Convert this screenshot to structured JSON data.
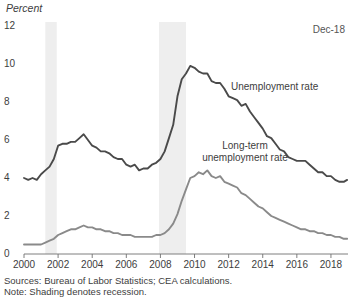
{
  "chart_data": {
    "type": "line",
    "title": "",
    "subtitle": "",
    "xlabel": "",
    "ylabel": "Percent",
    "ylim": [
      0,
      12
    ],
    "xlim": [
      2000.0,
      2019.0
    ],
    "yticks": [
      0,
      2,
      4,
      6,
      8,
      10,
      12
    ],
    "xticks": [
      2000,
      2002,
      2004,
      2006,
      2008,
      2010,
      2012,
      2014,
      2016,
      2018
    ],
    "grid": false,
    "legend_position": "inline-annotations",
    "annotations": [
      {
        "text": "Dec-18",
        "position": "top-right"
      },
      {
        "text": "Unemployment rate",
        "series": "Unemployment rate"
      },
      {
        "text": "Long-term unemployment rate",
        "series": "Long-term unemployment rate"
      }
    ],
    "shaded_regions": [
      {
        "label": "recession",
        "x0": 2001.25,
        "x1": 2001.92
      },
      {
        "label": "recession",
        "x0": 2007.92,
        "x1": 2009.5
      }
    ],
    "series": [
      {
        "name": "Unemployment rate",
        "color": "#4a4a4a",
        "x": [
          2000.0,
          2000.25,
          2000.5,
          2000.75,
          2001.0,
          2001.25,
          2001.5,
          2001.75,
          2002.0,
          2002.25,
          2002.5,
          2002.75,
          2003.0,
          2003.25,
          2003.5,
          2003.75,
          2004.0,
          2004.25,
          2004.5,
          2004.75,
          2005.0,
          2005.25,
          2005.5,
          2005.75,
          2006.0,
          2006.25,
          2006.5,
          2006.75,
          2007.0,
          2007.25,
          2007.5,
          2007.75,
          2008.0,
          2008.25,
          2008.5,
          2008.75,
          2009.0,
          2009.25,
          2009.5,
          2009.75,
          2010.0,
          2010.25,
          2010.5,
          2010.75,
          2011.0,
          2011.25,
          2011.5,
          2011.75,
          2012.0,
          2012.25,
          2012.5,
          2012.75,
          2013.0,
          2013.25,
          2013.5,
          2013.75,
          2014.0,
          2014.25,
          2014.5,
          2014.75,
          2015.0,
          2015.25,
          2015.5,
          2015.75,
          2016.0,
          2016.25,
          2016.5,
          2016.75,
          2017.0,
          2017.25,
          2017.5,
          2017.75,
          2018.0,
          2018.25,
          2018.5,
          2018.75,
          2018.95
        ],
        "values": [
          4.0,
          3.9,
          4.0,
          3.9,
          4.2,
          4.4,
          4.6,
          5.0,
          5.7,
          5.8,
          5.8,
          5.9,
          5.9,
          6.1,
          6.3,
          6.0,
          5.7,
          5.6,
          5.4,
          5.4,
          5.3,
          5.1,
          5.0,
          5.0,
          4.7,
          4.6,
          4.7,
          4.4,
          4.5,
          4.5,
          4.7,
          4.8,
          5.0,
          5.4,
          6.1,
          6.8,
          8.3,
          9.2,
          9.5,
          9.9,
          9.8,
          9.6,
          9.5,
          9.5,
          9.1,
          9.0,
          9.0,
          8.7,
          8.3,
          8.2,
          8.1,
          7.8,
          7.9,
          7.5,
          7.2,
          6.9,
          6.6,
          6.2,
          6.1,
          5.8,
          5.5,
          5.4,
          5.1,
          5.0,
          4.9,
          4.9,
          4.9,
          4.7,
          4.5,
          4.3,
          4.3,
          4.1,
          4.1,
          3.9,
          3.8,
          3.8,
          3.9
        ]
      },
      {
        "name": "Long-term unemployment rate",
        "color": "#8a8a8a",
        "x": [
          2000.0,
          2000.25,
          2000.5,
          2000.75,
          2001.0,
          2001.25,
          2001.5,
          2001.75,
          2002.0,
          2002.25,
          2002.5,
          2002.75,
          2003.0,
          2003.25,
          2003.5,
          2003.75,
          2004.0,
          2004.25,
          2004.5,
          2004.75,
          2005.0,
          2005.25,
          2005.5,
          2005.75,
          2006.0,
          2006.25,
          2006.5,
          2006.75,
          2007.0,
          2007.25,
          2007.5,
          2007.75,
          2008.0,
          2008.25,
          2008.5,
          2008.75,
          2009.0,
          2009.25,
          2009.5,
          2009.75,
          2010.0,
          2010.25,
          2010.5,
          2010.75,
          2011.0,
          2011.25,
          2011.5,
          2011.75,
          2012.0,
          2012.25,
          2012.5,
          2012.75,
          2013.0,
          2013.25,
          2013.5,
          2013.75,
          2014.0,
          2014.25,
          2014.5,
          2014.75,
          2015.0,
          2015.25,
          2015.5,
          2015.75,
          2016.0,
          2016.25,
          2016.5,
          2016.75,
          2017.0,
          2017.25,
          2017.5,
          2017.75,
          2018.0,
          2018.25,
          2018.5,
          2018.75,
          2018.95
        ],
        "values": [
          0.5,
          0.5,
          0.5,
          0.5,
          0.5,
          0.6,
          0.7,
          0.8,
          1.0,
          1.1,
          1.2,
          1.3,
          1.3,
          1.4,
          1.5,
          1.4,
          1.4,
          1.3,
          1.3,
          1.2,
          1.2,
          1.1,
          1.1,
          1.0,
          1.0,
          1.0,
          0.9,
          0.9,
          0.9,
          0.9,
          0.9,
          1.0,
          1.0,
          1.1,
          1.3,
          1.6,
          2.1,
          2.8,
          3.4,
          4.0,
          4.1,
          4.3,
          4.2,
          4.4,
          4.1,
          4.0,
          4.1,
          3.8,
          3.7,
          3.6,
          3.5,
          3.2,
          3.1,
          2.9,
          2.7,
          2.5,
          2.4,
          2.2,
          2.0,
          1.9,
          1.8,
          1.7,
          1.6,
          1.5,
          1.4,
          1.3,
          1.3,
          1.2,
          1.2,
          1.1,
          1.1,
          1.0,
          1.0,
          0.9,
          0.9,
          0.8,
          0.8
        ]
      }
    ]
  },
  "figure": {
    "y_axis_unit": "Percent",
    "last_observation": "Dec-18",
    "yticks": [
      "12",
      "10",
      "8",
      "6",
      "4",
      "2",
      "0"
    ],
    "xticks": [
      "2000",
      "2002",
      "2004",
      "2006",
      "2008",
      "2010",
      "2012",
      "2014",
      "2016",
      "2018"
    ],
    "label_unemployment": "Unemployment rate",
    "label_longterm_line1": "Long-term",
    "label_longterm_line2": "unemployment rate",
    "source_note": "Sources: Bureau of Labor Statistics; CEA calculations.",
    "shading_note": "Note: Shading denotes recession."
  },
  "colors": {
    "unemployment": "#4a4a4a",
    "longterm": "#8a8a8a",
    "recession_band": "#eeeeee",
    "axis": "#6f6f6f",
    "text": "#3d3d3d"
  }
}
